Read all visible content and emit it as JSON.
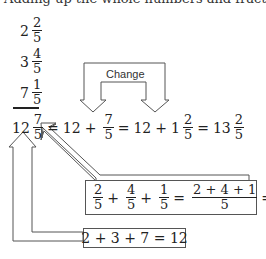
{
  "top_text": "Adding up the whole numbers and fractions separately",
  "addends": [
    {
      "whole": "2",
      "num": "2",
      "den": "5"
    },
    {
      "whole": "3",
      "num": "4",
      "den": "5"
    },
    {
      "whole": "7",
      "num": "1",
      "den": "5"
    }
  ],
  "result_line": {
    "t1_whole": "12",
    "t1_num": "7",
    "t1_den": "5",
    "eq": "=",
    "t2_whole": "12",
    "plus": "+",
    "t2_num": "7",
    "t2_den": "5",
    "t3_whole": "12",
    "t3_one": "1",
    "t3_num": "2",
    "t3_den": "5",
    "t4_whole": "13",
    "t4_num": "2",
    "t4_den": "5"
  },
  "change_label": "Change",
  "fraction_box": {
    "a_num": "2",
    "a_den": "5",
    "b_num": "4",
    "b_den": "5",
    "c_num": "1",
    "c_den": "5",
    "sum_num": "2 + 4 + 1",
    "sum_den": "5",
    "res_num": "7",
    "res_den": "5",
    "plus": "+",
    "eq": "="
  },
  "whole_box": {
    "expression": "2 + 3 + 7 = 12"
  }
}
